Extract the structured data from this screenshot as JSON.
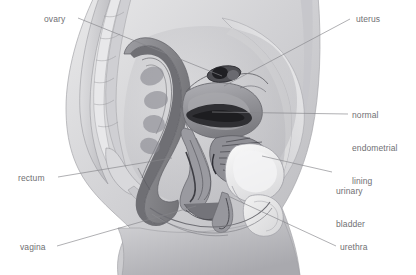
{
  "figure": {
    "view": "midsagittal section",
    "style": "grayscale medical illustration",
    "width": 416,
    "height": 275,
    "background_color": "#ffffff",
    "label_color": "#6f6f73",
    "leader_line_color": "#8a8a8e"
  },
  "labels": [
    {
      "id": "ovary",
      "text": "ovary",
      "lines": [
        "ovary"
      ],
      "x": 44,
      "y": 14,
      "align": "left",
      "leader": {
        "x1": 78,
        "y1": 18,
        "x2": 222,
        "y2": 76
      }
    },
    {
      "id": "uterus",
      "text": "uterus",
      "lines": [
        "uterus"
      ],
      "x": 356,
      "y": 14,
      "align": "left",
      "leader": {
        "x1": 350,
        "y1": 19,
        "x2": 224,
        "y2": 86
      }
    },
    {
      "id": "normal-endometrial-lining",
      "text": "normal endometrial lining",
      "lines": [
        "normal",
        "endometrial",
        "lining"
      ],
      "x": 352,
      "y": 88,
      "align": "left",
      "leader": {
        "x1": 348,
        "y1": 114,
        "x2": 212,
        "y2": 112
      }
    },
    {
      "id": "urinary-bladder",
      "text": "urinary bladder",
      "lines": [
        "urinary",
        "bladder"
      ],
      "x": 336,
      "y": 164,
      "align": "left",
      "leader": {
        "x1": 332,
        "y1": 172,
        "x2": 262,
        "y2": 156
      }
    },
    {
      "id": "urethra",
      "text": "urethra",
      "lines": [
        "urethra"
      ],
      "x": 340,
      "y": 242,
      "align": "left",
      "leader": {
        "x1": 336,
        "y1": 246,
        "x2": 228,
        "y2": 196
      }
    },
    {
      "id": "rectum",
      "text": "rectum",
      "lines": [
        "rectum"
      ],
      "x": 18,
      "y": 173,
      "align": "left",
      "leader": {
        "x1": 58,
        "y1": 177,
        "x2": 172,
        "y2": 158
      }
    },
    {
      "id": "vagina",
      "text": "vagina",
      "lines": [
        "vagina"
      ],
      "x": 20,
      "y": 242,
      "align": "left",
      "leader": {
        "x1": 57,
        "y1": 246,
        "x2": 196,
        "y2": 206
      }
    }
  ],
  "structures": [
    {
      "id": "body-outline",
      "name": "torso and thigh silhouette",
      "tone": "#cfcfd2"
    },
    {
      "id": "sacrum-spine",
      "name": "sacrum and lumbar vertebrae",
      "tone": "#bdbdc1"
    },
    {
      "id": "abdominal-wall",
      "name": "anterior abdominal wall",
      "tone": "#d8d8da"
    },
    {
      "id": "rectum",
      "name": "rectum",
      "tone": "#8e8e93"
    },
    {
      "id": "uterus",
      "name": "uterus body",
      "tone": "#9a9a9f"
    },
    {
      "id": "endometrium",
      "name": "endometrial lining",
      "tone": "#3a3a3e"
    },
    {
      "id": "cervix",
      "name": "cervix",
      "tone": "#8a8a8f"
    },
    {
      "id": "vagina",
      "name": "vaginal canal",
      "tone": "#6e6e73"
    },
    {
      "id": "bladder",
      "name": "urinary bladder",
      "tone": "#f0f0f0"
    },
    {
      "id": "urethra",
      "name": "urethra",
      "tone": "#8a8a8f"
    },
    {
      "id": "ovary",
      "name": "ovary",
      "tone": "#4a4a4e"
    },
    {
      "id": "pubic-bone",
      "name": "pubic symphysis",
      "tone": "#e8e8ea"
    }
  ]
}
